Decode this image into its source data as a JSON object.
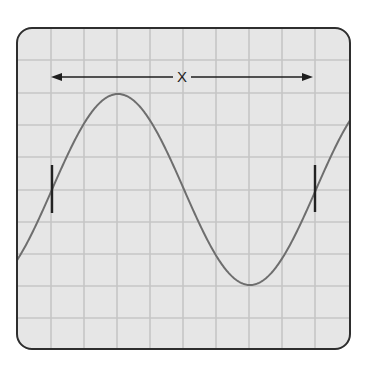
{
  "diagram": {
    "type": "oscilloscope-waveform",
    "colors": {
      "background": "#ffffff",
      "screen_fill": "#e6e6e6",
      "grid_line": "#c6c6c6",
      "frame_border": "#2e2e2e",
      "wave": "#6e6e6e",
      "markers": "#222222",
      "arrow": "#1e1e1e"
    },
    "frame": {
      "x": 17,
      "y": 28,
      "width": 333,
      "height": 321,
      "corner_radius": 15
    },
    "grid": {
      "vertical_lines_x": [
        51,
        84,
        117,
        150,
        183,
        216,
        249,
        282,
        315
      ],
      "horizontal_lines_y": [
        60,
        93,
        125,
        157,
        190,
        222,
        254,
        286,
        318
      ]
    },
    "wave": {
      "center_y": 189.5,
      "amplitude": 95.5,
      "period_px": 264,
      "rising_zero_x": 52,
      "peak": {
        "x": 118,
        "y": 94
      },
      "trough": {
        "x": 250,
        "y": 285
      }
    },
    "markers": [
      {
        "x": 52,
        "y1": 165,
        "y2": 213
      },
      {
        "x": 315,
        "y1": 165,
        "y2": 212
      }
    ],
    "dimension": {
      "label": "X",
      "y": 77,
      "x_start": 51,
      "x_end": 313,
      "label_x": 182
    }
  }
}
